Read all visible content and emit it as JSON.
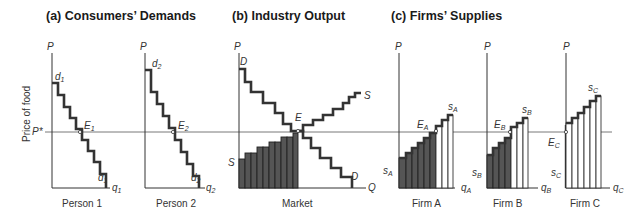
{
  "titles": {
    "a": "(a) Consumers’ Demands",
    "b": "(b) Industry Output",
    "c": "(c) Firms’ Supplies"
  },
  "y_axis_label": "Price of food",
  "p_star_label": "P*",
  "axis_p": "P",
  "panels": [
    {
      "id": "person1",
      "caption": "Person 1",
      "curve_top": "d",
      "curve_top_sub": "1",
      "curve_bot": "d",
      "curve_bot_sub": "1",
      "x_axis": "q",
      "x_axis_sub": "1",
      "eq": "E",
      "eq_sub": "1"
    },
    {
      "id": "person2",
      "caption": "Person 2",
      "curve_top": "d",
      "curve_top_sub": "2",
      "curve_bot": "d",
      "curve_bot_sub": "2",
      "x_axis": "q",
      "x_axis_sub": "2",
      "eq": "E",
      "eq_sub": "2"
    },
    {
      "id": "market",
      "caption": "Market",
      "demand": "D",
      "supply": "S",
      "x_axis": "Q",
      "eq": "E"
    },
    {
      "id": "firmA",
      "caption": "Firm A",
      "supply": "s",
      "supply_sub": "A",
      "x_axis": "q",
      "x_axis_sub": "A",
      "eq": "E",
      "eq_sub": "A"
    },
    {
      "id": "firmB",
      "caption": "Firm B",
      "supply": "s",
      "supply_sub": "B",
      "x_axis": "q",
      "x_axis_sub": "B",
      "eq": "E",
      "eq_sub": "B"
    },
    {
      "id": "firmC",
      "caption": "Firm C",
      "supply": "s",
      "supply_sub": "C",
      "x_axis": "q",
      "x_axis_sub": "C",
      "eq": "E",
      "eq_sub": "C"
    }
  ],
  "colors": {
    "shaded": "#555555",
    "line": "#333333"
  }
}
